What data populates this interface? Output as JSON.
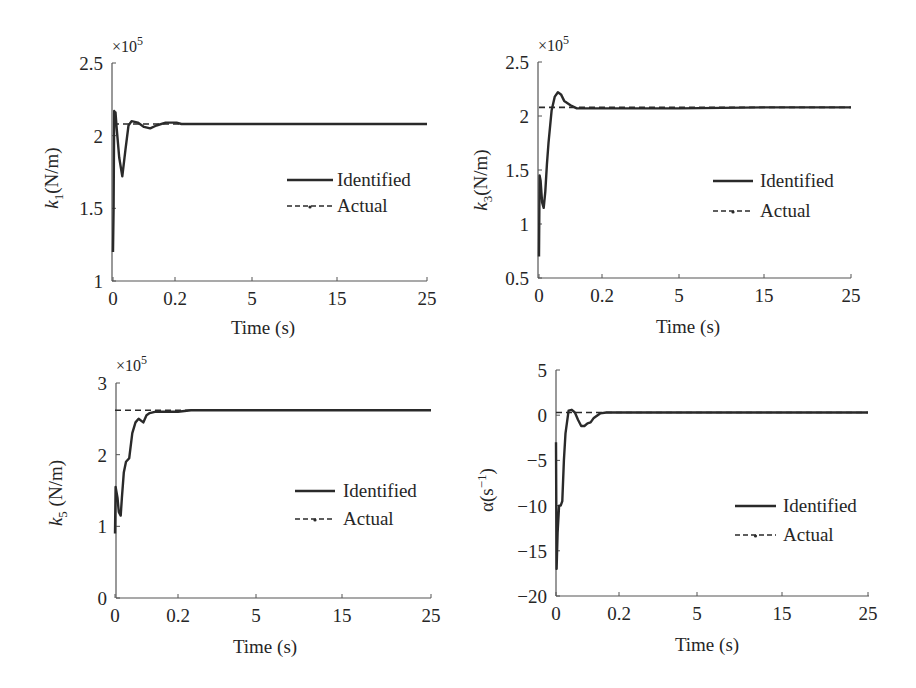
{
  "colors": {
    "line": "#2a2a2a",
    "axis": "#555555",
    "background": "#ffffff"
  },
  "legend": {
    "identified_label": "Identified",
    "actual_label": "Actual"
  },
  "chart_data": [
    {
      "id": "k1",
      "type": "line",
      "title": "",
      "xlabel": "Time (s)",
      "ylabel": "k1(N/m)",
      "ylabel_main": "k",
      "ylabel_sub": "1",
      "ylabel_rest": "(N/m)",
      "y_multiplier": "×10",
      "y_multiplier_exp": "5",
      "x_ticks": [
        "0",
        "0.2",
        "5",
        "15",
        "25"
      ],
      "x_tick_values": [
        0,
        0.2,
        5,
        15,
        25
      ],
      "x_scale": "piecewise (non-uniform)",
      "y_ticks": [
        "1",
        "1.5",
        "2",
        "2.5"
      ],
      "y_tick_values": [
        1,
        1.5,
        2,
        2.5
      ],
      "ylim": [
        1,
        2.5
      ],
      "xlim": [
        0,
        25
      ],
      "grid": false,
      "legend_position": "center-right",
      "series": [
        {
          "name": "Identified",
          "style": "solid",
          "x": [
            0,
            0.002,
            0.004,
            0.006,
            0.008,
            0.012,
            0.02,
            0.03,
            0.04,
            0.05,
            0.06,
            0.08,
            0.1,
            0.12,
            0.14,
            0.17,
            0.2,
            0.3,
            0.6,
            1,
            5,
            15,
            25
          ],
          "y": [
            1.2,
            1.5,
            2.17,
            2.1,
            2.16,
            2.05,
            1.85,
            1.72,
            1.9,
            2.07,
            2.1,
            2.09,
            2.06,
            2.05,
            2.07,
            2.09,
            2.09,
            2.09,
            2.08,
            2.08,
            2.08,
            2.08,
            2.08
          ]
        },
        {
          "name": "Actual",
          "style": "dashed",
          "x": [
            0,
            25
          ],
          "y": [
            2.08,
            2.08
          ]
        }
      ]
    },
    {
      "id": "k3",
      "type": "line",
      "title": "",
      "xlabel": "Time (s)",
      "ylabel": "k3(N/m)",
      "ylabel_main": "k",
      "ylabel_sub": "3",
      "ylabel_rest": "(N/m)",
      "y_multiplier": "×10",
      "y_multiplier_exp": "5",
      "x_ticks": [
        "0",
        "0.2",
        "5",
        "15",
        "25"
      ],
      "x_tick_values": [
        0,
        0.2,
        5,
        15,
        25
      ],
      "x_scale": "piecewise (non-uniform)",
      "y_ticks": [
        "0.5",
        "1",
        "1.5",
        "2",
        "2.5"
      ],
      "y_tick_values": [
        0.5,
        1,
        1.5,
        2,
        2.5
      ],
      "ylim": [
        0.5,
        2.5
      ],
      "xlim": [
        0,
        25
      ],
      "grid": false,
      "legend_position": "center-right",
      "series": [
        {
          "name": "Identified",
          "style": "solid",
          "x": [
            0,
            0.002,
            0.005,
            0.01,
            0.015,
            0.02,
            0.025,
            0.03,
            0.04,
            0.05,
            0.06,
            0.07,
            0.08,
            0.1,
            0.12,
            0.14,
            0.2,
            1,
            5,
            15,
            25
          ],
          "y": [
            0.7,
            1.45,
            1.4,
            1.2,
            1.15,
            1.3,
            1.55,
            1.75,
            2.05,
            2.18,
            2.22,
            2.2,
            2.14,
            2.1,
            2.07,
            2.07,
            2.07,
            2.07,
            2.07,
            2.08,
            2.08
          ]
        },
        {
          "name": "Actual",
          "style": "dashed",
          "x": [
            0,
            25
          ],
          "y": [
            2.08,
            2.08
          ]
        }
      ]
    },
    {
      "id": "k5",
      "type": "line",
      "title": "",
      "xlabel": "Time (s)",
      "ylabel": "k5 (N/m)",
      "ylabel_main": "k",
      "ylabel_sub": "5",
      "ylabel_rest": " (N/m)",
      "y_multiplier": "×10",
      "y_multiplier_exp": "5",
      "x_ticks": [
        "0",
        "0.2",
        "5",
        "15",
        "25"
      ],
      "x_tick_values": [
        0,
        0.2,
        5,
        15,
        25
      ],
      "x_scale": "piecewise (non-uniform)",
      "y_ticks": [
        "0",
        "1",
        "2",
        "3"
      ],
      "y_tick_values": [
        0,
        1,
        2,
        3
      ],
      "ylim": [
        0,
        3
      ],
      "xlim": [
        0,
        25
      ],
      "grid": false,
      "legend_position": "center-right",
      "series": [
        {
          "name": "Identified",
          "style": "solid",
          "x": [
            0,
            0.002,
            0.008,
            0.012,
            0.018,
            0.022,
            0.028,
            0.035,
            0.045,
            0.055,
            0.065,
            0.075,
            0.09,
            0.1,
            0.11,
            0.13,
            0.15,
            0.2,
            1,
            5,
            15,
            25
          ],
          "y": [
            0.9,
            1.55,
            1.4,
            1.2,
            1.15,
            1.4,
            1.75,
            1.9,
            1.95,
            2.3,
            2.45,
            2.5,
            2.45,
            2.55,
            2.58,
            2.6,
            2.6,
            2.6,
            2.62,
            2.62,
            2.62,
            2.62
          ]
        },
        {
          "name": "Actual",
          "style": "dashed",
          "x": [
            0,
            25
          ],
          "y": [
            2.62,
            2.62
          ]
        }
      ]
    },
    {
      "id": "alpha",
      "type": "line",
      "title": "",
      "xlabel": "Time (s)",
      "ylabel": "α(s⁻¹)",
      "ylabel_main": "α(s",
      "ylabel_sup": "−1",
      "ylabel_rest": ")",
      "y_multiplier": "",
      "y_multiplier_exp": "",
      "x_ticks": [
        "0",
        "0.2",
        "5",
        "15",
        "25"
      ],
      "x_tick_values": [
        0,
        0.2,
        5,
        15,
        25
      ],
      "x_scale": "piecewise (non-uniform)",
      "y_ticks": [
        "−20",
        "−15",
        "−10",
        "−5",
        "0",
        "5"
      ],
      "y_tick_values": [
        -20,
        -15,
        -10,
        -5,
        0,
        5
      ],
      "ylim": [
        -20,
        5
      ],
      "xlim": [
        0,
        25
      ],
      "grid": false,
      "legend_position": "center-right",
      "series": [
        {
          "name": "Identified",
          "style": "solid",
          "x": [
            0,
            0.002,
            0.005,
            0.01,
            0.015,
            0.02,
            0.025,
            0.03,
            0.04,
            0.05,
            0.06,
            0.07,
            0.08,
            0.09,
            0.1,
            0.11,
            0.12,
            0.14,
            0.16,
            0.2,
            1,
            5,
            15,
            25
          ],
          "y": [
            -3,
            -17,
            -13,
            -10,
            -10,
            -9.5,
            -5,
            -2,
            0.5,
            0.6,
            0.3,
            -0.5,
            -1.2,
            -1.2,
            -0.9,
            -0.8,
            -0.3,
            0.2,
            0.3,
            0.3,
            0.3,
            0.3,
            0.3,
            0.3
          ]
        },
        {
          "name": "Actual",
          "style": "dashed",
          "x": [
            0,
            25
          ],
          "y": [
            0.3,
            0.3
          ]
        }
      ]
    }
  ],
  "layout": [
    {
      "plot": {
        "left": 112,
        "top": 63,
        "right": 427,
        "bottom": 281
      },
      "x_tick_px": [
        113,
        175,
        252,
        337,
        427
      ],
      "legend": {
        "x1": 287,
        "x2": 333,
        "tx": 337,
        "y1": 180,
        "y2": 206
      },
      "ylabel_pos": {
        "x": 52,
        "y": 178
      },
      "xlabel_pos": {
        "x": 263,
        "y": 328
      },
      "mult_pos": {
        "x": 112,
        "y": 52
      }
    },
    {
      "plot": {
        "left": 538,
        "top": 62,
        "right": 851,
        "bottom": 278
      },
      "x_tick_px": [
        539,
        602,
        679,
        764,
        851
      ],
      "legend": {
        "x1": 713,
        "x2": 753,
        "tx": 760,
        "y1": 181,
        "y2": 211
      },
      "ylabel_pos": {
        "x": 481,
        "y": 180
      },
      "xlabel_pos": {
        "x": 688,
        "y": 327
      },
      "mult_pos": {
        "x": 538,
        "y": 51
      }
    },
    {
      "plot": {
        "left": 116,
        "top": 383,
        "right": 431,
        "bottom": 598
      },
      "x_tick_px": [
        115,
        178,
        256,
        342,
        431
      ],
      "legend": {
        "x1": 295,
        "x2": 335,
        "tx": 343,
        "y1": 491,
        "y2": 519
      },
      "ylabel_pos": {
        "x": 56,
        "y": 493
      },
      "xlabel_pos": {
        "x": 265,
        "y": 647
      },
      "mult_pos": {
        "x": 116,
        "y": 371
      }
    },
    {
      "plot": {
        "left": 556,
        "top": 370,
        "right": 869,
        "bottom": 596
      },
      "x_tick_px": [
        556,
        619,
        697,
        782,
        868
      ],
      "legend": {
        "x1": 735,
        "x2": 776,
        "tx": 783,
        "y1": 506,
        "y2": 535
      },
      "ylabel_pos": {
        "x": 487,
        "y": 490
      },
      "xlabel_pos": {
        "x": 707,
        "y": 645
      },
      "mult_pos": {
        "x": 556,
        "y": 358
      }
    }
  ]
}
